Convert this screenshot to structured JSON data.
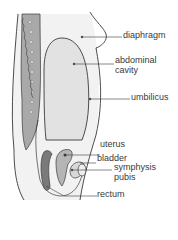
{
  "diagram": {
    "colors": {
      "line": "#3a3a3a",
      "cavity": "#e4e4e4",
      "body": "#efefef",
      "spine": "#a8a8a8",
      "rectum": "#7a7a7a"
    },
    "labels": [
      {
        "id": "diaphragm",
        "text": "diaphragm"
      },
      {
        "id": "abdominal",
        "text": "abdominal"
      },
      {
        "id": "cavity",
        "text": "cavity"
      },
      {
        "id": "umbilicus",
        "text": "umbilicus"
      },
      {
        "id": "uterus",
        "text": "uterus"
      },
      {
        "id": "bladder",
        "text": "bladder"
      },
      {
        "id": "symphysis",
        "text": "symphysis"
      },
      {
        "id": "pubis",
        "text": "pubis"
      },
      {
        "id": "rectum",
        "text": "rectum"
      }
    ]
  }
}
